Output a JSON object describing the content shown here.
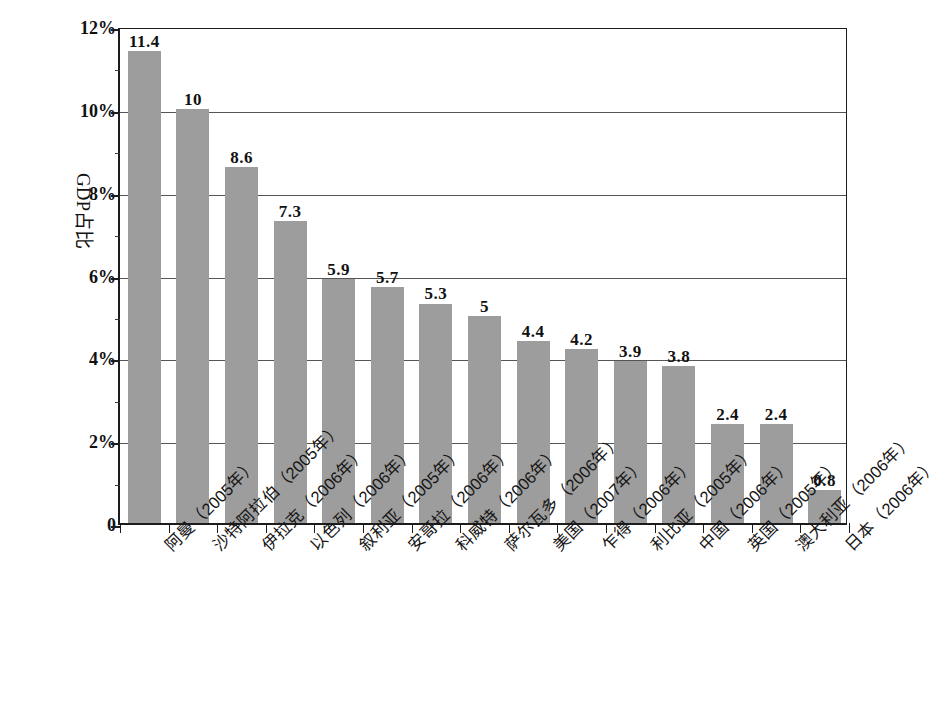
{
  "chart_data": {
    "type": "bar",
    "title": "",
    "subtitle": "",
    "xlabel": "",
    "ylabel": "GDP占比",
    "ylim": [
      0,
      12
    ],
    "ytick_values": [
      0,
      2,
      4,
      6,
      8,
      10,
      12
    ],
    "ytick_labels": [
      "0",
      "2%",
      "4%",
      "6%",
      "8%",
      "10%",
      "12%"
    ],
    "grid": true,
    "legend": "none",
    "value_unit": "percent",
    "categories": [
      "阿曼（2005年）",
      "沙特阿拉伯（2005年）",
      "伊拉克（2006年）",
      "以色列（2006年）",
      "叙利亚（2005年）",
      "安哥拉（2006年）",
      "科威特（2006年）",
      "萨尔瓦多（2006年）",
      "美国（2007年）",
      "乍得（2006年）",
      "利比亚（2005年）",
      "中国（2006年）",
      "英国（2005年）",
      "澳大利亚（2006年）",
      "日本（2006年）"
    ],
    "values": [
      11.4,
      10,
      8.6,
      7.3,
      5.9,
      5.7,
      5.3,
      5,
      4.4,
      4.2,
      3.9,
      3.8,
      2.4,
      2.4,
      0.8
    ],
    "value_labels": [
      "11.4",
      "10",
      "8.6",
      "7.3",
      "5.9",
      "5.7",
      "5.3",
      "5",
      "4.4",
      "4.2",
      "3.9",
      "3.8",
      "2.4",
      "2.4",
      "0.8"
    ],
    "bar_color": "#9d9d9d",
    "axis_color": "#1c1c1c",
    "gridline_color": "#555555",
    "background_color": "#ffffff"
  }
}
